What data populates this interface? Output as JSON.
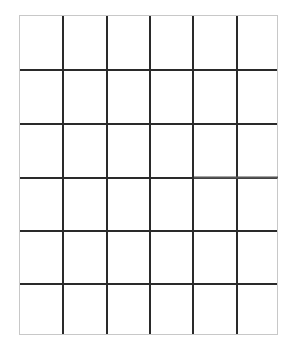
{
  "grid": {
    "rows": 6,
    "cols": 6,
    "line_color": "#2a2a2a",
    "border_color": "#c8c8c8",
    "background": "#ffffff"
  }
}
